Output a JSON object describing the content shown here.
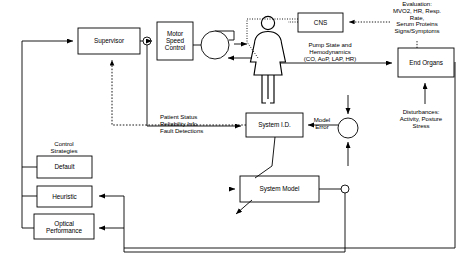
{
  "diagram": {
    "type": "block-diagram",
    "colors": {
      "stroke": "#000000",
      "background": "#ffffff",
      "text": "#000000"
    },
    "blocks": [
      {
        "id": "supervisor",
        "label": "Supervisor",
        "x": 78,
        "y": 28,
        "w": 62,
        "h": 26
      },
      {
        "id": "motor-speed-control",
        "label": "Motor\nSpeed\nControl",
        "x": 157,
        "y": 22,
        "w": 36,
        "h": 38
      },
      {
        "id": "cns",
        "label": "CNS",
        "x": 298,
        "y": 13,
        "w": 45,
        "h": 19
      },
      {
        "id": "end-organs",
        "label": "End Organs",
        "x": 398,
        "y": 48,
        "w": 56,
        "h": 29
      },
      {
        "id": "system-id",
        "label": "System I.D.",
        "x": 246,
        "y": 113,
        "w": 57,
        "h": 24
      },
      {
        "id": "system-model",
        "label": "System Model",
        "x": 240,
        "y": 176,
        "w": 79,
        "h": 26
      },
      {
        "id": "default",
        "label": "Default",
        "x": 37,
        "y": 156,
        "w": 55,
        "h": 22
      },
      {
        "id": "heuristic",
        "label": "Heuristic",
        "x": 37,
        "y": 186,
        "w": 55,
        "h": 21
      },
      {
        "id": "optical-performance",
        "label": "Optical\nPerformance",
        "x": 34,
        "y": 214,
        "w": 60,
        "h": 25
      }
    ],
    "annotations": [
      {
        "id": "control-strategies",
        "text": "Control\nStrategies",
        "x": 64,
        "y": 141
      },
      {
        "id": "patient-status",
        "text": "Patient Status\nReliability Info\nFault Detections",
        "x": 205,
        "y": 123
      },
      {
        "id": "pump-state",
        "text": "Pump State and\nHemodynamics\n(CO, AoP, LAP, HR)",
        "x": 330,
        "y": 52
      },
      {
        "id": "evaluation",
        "text": "Evaluation:\nMVO2, HR, Resp. Rate,\nSerum Proteins\nSigns/Symptoms",
        "x": 417,
        "y": 18
      },
      {
        "id": "disturbances",
        "text": "Disturbances:\nActivity, Posture\nStress",
        "x": 421,
        "y": 119
      },
      {
        "id": "model-error",
        "text": "Model\nError",
        "x": 322,
        "y": 122
      }
    ],
    "nodes": [
      {
        "id": "supervisor-junction",
        "shape": "circle",
        "x": 147,
        "y": 41,
        "r": 4
      },
      {
        "id": "pump-rotor",
        "shape": "circle",
        "x": 215,
        "y": 45,
        "r": 14
      },
      {
        "id": "summing-junction",
        "shape": "circle",
        "x": 348,
        "y": 128,
        "r": 10
      },
      {
        "id": "model-output-node",
        "shape": "circle",
        "x": 345,
        "y": 189,
        "r": 4
      }
    ],
    "figure": {
      "id": "patient",
      "label": "patient-figure",
      "x": 268,
      "y": 58
    }
  }
}
